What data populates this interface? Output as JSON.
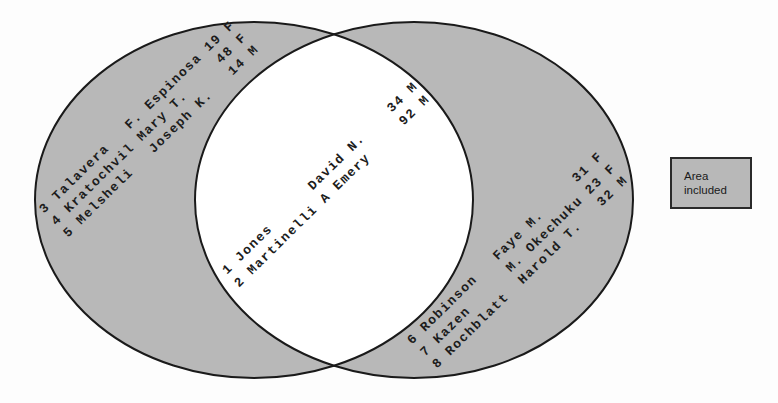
{
  "diagram": {
    "type": "venn",
    "colors": {
      "included_fill": "#b8b8b8",
      "excluded_fill": "#ffffff",
      "outline": "#1a1a1a"
    },
    "sets": [
      {
        "name": "left-set",
        "region": "left-only",
        "records": [
          "3 Talavera   F. Espinosa 19 F",
          "4 Kratochvil Mary T.     48 F",
          "5 Melsheli   Joseph K.   14 M"
        ]
      },
      {
        "name": "intersection",
        "region": "both",
        "records": [
          "1 Jones      David N.    34 M",
          "2 Martinelli A Emery     92 M"
        ]
      },
      {
        "name": "right-set",
        "region": "right-only",
        "records": [
          "6 Robinson   Faye M.     31 F",
          "7 Kazen      M. Okechuku 23 F",
          "8 Rochblatt  Harold T.   32 M"
        ]
      }
    ],
    "legend": {
      "line1": "Area",
      "line2": "included"
    }
  }
}
